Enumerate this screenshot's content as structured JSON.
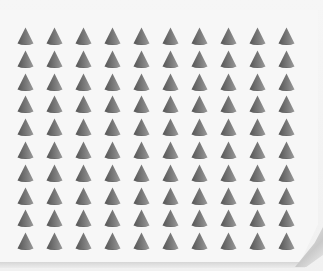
{
  "scene": {
    "description": "Grid of identical grey cones on a white card with a curled bottom-right corner",
    "background_color": "#f3f3f3",
    "card_color": "#f7f7f7"
  },
  "grid": {
    "rows": 10,
    "columns": 10,
    "total_items": 100,
    "origin_x": 17,
    "origin_y": 27,
    "spacing_x": 29,
    "spacing_y": 22.8,
    "item": {
      "shape": "cone",
      "width": 17,
      "height": 19,
      "color_dark": "#555555",
      "color_mid": "#7a7a7a",
      "color_light": "#9a9a9a",
      "base_color": "#5e5e5e"
    }
  }
}
